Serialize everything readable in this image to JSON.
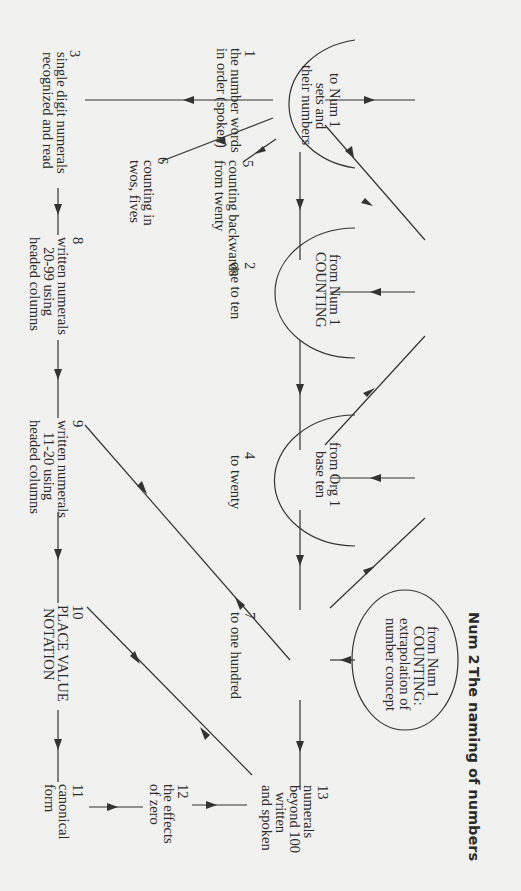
{
  "title": {
    "number": "Num 2",
    "text": "The naming of numbers"
  },
  "orientation": "rotated 90 degrees clockwise",
  "external_nodes": [
    {
      "id": "to-num1-sets",
      "lines": [
        "to Num 1",
        "sets and",
        "their numbers"
      ]
    },
    {
      "id": "from-num1-counting",
      "lines": [
        "from Num 1",
        "COUNTING"
      ]
    },
    {
      "id": "from-org1-base-ten",
      "lines": [
        "from Org 1",
        "base ten"
      ]
    },
    {
      "id": "from-num1-counting-extrapolation",
      "lines": [
        "from Num 1",
        "COUNTING:",
        "extrapolation of",
        "number concept"
      ]
    }
  ],
  "nodes": [
    {
      "num": "1",
      "lines": [
        "the number words",
        "in order (spoken)"
      ]
    },
    {
      "num": "2",
      "lines": [
        "one to ten"
      ]
    },
    {
      "num": "3",
      "lines": [
        "single digit numerals",
        "recognized and read"
      ]
    },
    {
      "num": "4",
      "lines": [
        "to twenty"
      ]
    },
    {
      "num": "5",
      "lines": [
        "counting backwards",
        "from twenty"
      ]
    },
    {
      "num": "6",
      "lines": [
        "counting in",
        "twos, fives"
      ]
    },
    {
      "num": "7",
      "lines": [
        "to one hundred"
      ]
    },
    {
      "num": "8",
      "lines": [
        "written numerals",
        "20-99 using",
        "headed columns"
      ]
    },
    {
      "num": "9",
      "lines": [
        "written numerals",
        "11-20 using",
        "headed columns"
      ]
    },
    {
      "num": "10",
      "lines": [
        "PLACE VALUE",
        "NOTATION"
      ]
    },
    {
      "num": "11",
      "lines": [
        "canonical",
        "form"
      ]
    },
    {
      "num": "12",
      "lines": [
        "the effects",
        "of zero"
      ]
    },
    {
      "num": "13",
      "lines": [
        "numerals",
        "beyond 100",
        "written",
        "and spoken"
      ]
    }
  ],
  "edges": [
    [
      "1",
      "to-num1-sets"
    ],
    [
      "from-num1-counting",
      "1"
    ],
    [
      "from-num1-counting",
      "2"
    ],
    [
      "from-num1-counting",
      "4"
    ],
    [
      "from-org1-base-ten",
      "4"
    ],
    [
      "from-org1-base-ten",
      "7"
    ],
    [
      "from-num1-counting-extrapolation",
      "7"
    ],
    [
      "1",
      "2"
    ],
    [
      "2",
      "4"
    ],
    [
      "4",
      "7"
    ],
    [
      "7",
      "13"
    ],
    [
      "1",
      "3"
    ],
    [
      "1",
      "5"
    ],
    [
      "1",
      "6"
    ],
    [
      "3",
      "8"
    ],
    [
      "8",
      "9"
    ],
    [
      "9",
      "10"
    ],
    [
      "10",
      "11"
    ],
    [
      "9",
      "7"
    ],
    [
      "10",
      "12"
    ],
    [
      "13",
      "12"
    ],
    [
      "12",
      "11"
    ]
  ]
}
